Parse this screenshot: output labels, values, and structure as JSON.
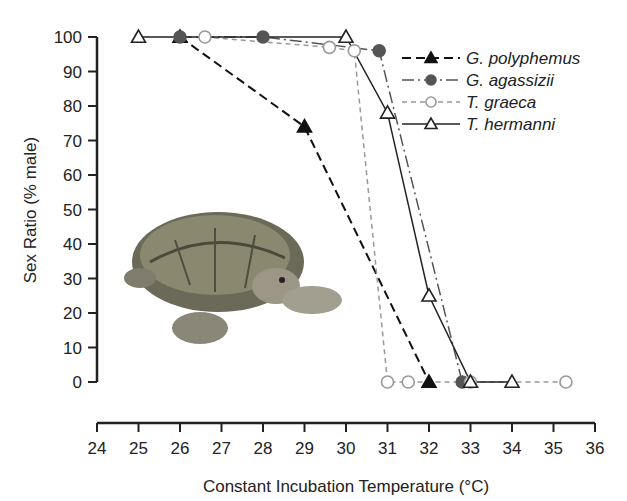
{
  "chart_data": {
    "type": "line",
    "title": "",
    "xlabel": "Constant Incubation Temperature (°C)",
    "ylabel": "Sex Ratio (% male)",
    "xlim": [
      24,
      36
    ],
    "ylim": [
      0,
      100
    ],
    "xticks": [
      24,
      25,
      26,
      27,
      28,
      29,
      30,
      31,
      32,
      33,
      34,
      35,
      36
    ],
    "yticks": [
      0,
      10,
      20,
      30,
      40,
      50,
      60,
      70,
      80,
      90,
      100
    ],
    "grid": false,
    "legend_position": "upper right",
    "series": [
      {
        "name": "G. polyphemus",
        "marker": "filled-triangle",
        "line": "dashed-black",
        "x": [
          26,
          29,
          32
        ],
        "y": [
          100,
          74,
          0
        ]
      },
      {
        "name": "G. agassizii",
        "marker": "filled-circle-gray",
        "line": "dash-dot-gray",
        "x": [
          26,
          28,
          30.8,
          32.8
        ],
        "y": [
          100,
          100,
          96,
          0
        ]
      },
      {
        "name": "T. graeca",
        "marker": "open-circle",
        "line": "dashed-lightgray",
        "x": [
          26.6,
          29.6,
          30.2,
          31,
          31.5,
          33,
          35.3
        ],
        "y": [
          100,
          97,
          96,
          0,
          0,
          0,
          0
        ]
      },
      {
        "name": "T. hermanni",
        "marker": "open-triangle",
        "line": "solid-black",
        "x": [
          25,
          30,
          31,
          32,
          33,
          34
        ],
        "y": [
          100,
          100,
          78,
          25,
          0,
          0
        ]
      }
    ],
    "annotations": [
      "tortoise photograph inset"
    ]
  },
  "labels": {
    "xlabel": "Constant Incubation Temperature (°C)",
    "ylabel": "Sex Ratio (% male)",
    "legend": [
      "G. polyphemus",
      "G. agassizii",
      "T. graeca",
      "T. hermanni"
    ]
  }
}
